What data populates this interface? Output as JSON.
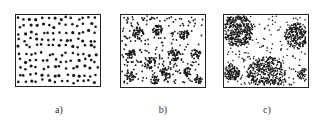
{
  "figure": {
    "panels": [
      {
        "id": "a",
        "label": "a)",
        "pattern": "uniform",
        "box": {
          "x": 15,
          "y": 14,
          "w": 86,
          "h": 73
        },
        "label_pos": {
          "x": 44,
          "y": 104
        },
        "dots": 140,
        "dot_r": 1.3,
        "seed": 11,
        "clusters": []
      },
      {
        "id": "b",
        "label": "b)",
        "pattern": "clustered",
        "box": {
          "x": 120,
          "y": 14,
          "w": 86,
          "h": 74
        },
        "label_pos": {
          "x": 148,
          "y": 104
        },
        "dots": 260,
        "dot_r": 0.9,
        "seed": 23,
        "clusters": [
          [
            18,
            19,
            6,
            40
          ],
          [
            38,
            16,
            5,
            35
          ],
          [
            65,
            20,
            5,
            30
          ],
          [
            10,
            40,
            5,
            30
          ],
          [
            30,
            50,
            6,
            40
          ],
          [
            55,
            42,
            6,
            40
          ],
          [
            78,
            40,
            5,
            25
          ],
          [
            48,
            60,
            6,
            35
          ],
          [
            70,
            60,
            5,
            30
          ],
          [
            10,
            64,
            5,
            25
          ],
          [
            35,
            68,
            4,
            20
          ],
          [
            80,
            68,
            4,
            20
          ]
        ]
      },
      {
        "id": "c",
        "label": "c)",
        "pattern": "segregated",
        "box": {
          "x": 223,
          "y": 14,
          "w": 86,
          "h": 74
        },
        "label_pos": {
          "x": 252,
          "y": 104
        },
        "dots": 200,
        "dot_r": 0.8,
        "seed": 37,
        "clusters": [
          [
            14,
            16,
            16,
            420
          ],
          [
            76,
            22,
            13,
            260
          ],
          [
            44,
            64,
            20,
            480
          ],
          [
            8,
            60,
            8,
            120
          ],
          [
            82,
            62,
            6,
            50
          ]
        ]
      }
    ],
    "colors": {
      "dot": "#1a1a1a",
      "border": "#222222",
      "background": "#ffffff"
    }
  }
}
